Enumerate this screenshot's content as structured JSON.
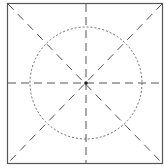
{
  "diagram": {
    "type": "composition-guide",
    "frame": {
      "x1": 7,
      "y1": 3,
      "x2": 163,
      "y2": 164,
      "stroke": "#555555"
    },
    "center": {
      "x": 86,
      "y": 83
    },
    "circle": {
      "cx": 86,
      "cy": 83,
      "r": 56,
      "stroke": "#666666",
      "style": "dotted"
    },
    "guides": [
      {
        "name": "vertical",
        "x1": 86,
        "y1": 3,
        "x2": 86,
        "y2": 164,
        "style": "dashed"
      },
      {
        "name": "horizontal",
        "x1": 7,
        "y1": 83,
        "x2": 163,
        "y2": 83,
        "style": "dashed"
      },
      {
        "name": "diagonal-main",
        "x1": 7,
        "y1": 3,
        "x2": 163,
        "y2": 164,
        "style": "dashed"
      },
      {
        "name": "diagonal-anti",
        "x1": 163,
        "y1": 3,
        "x2": 7,
        "y2": 164,
        "style": "dashed"
      }
    ],
    "guide_color": "#555555",
    "center_marker_color": "#222222"
  }
}
